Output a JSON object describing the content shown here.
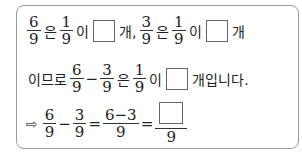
{
  "line1": {
    "f1": {
      "num": "6",
      "den": "9"
    },
    "t1": "은",
    "f2": {
      "num": "1",
      "den": "9"
    },
    "t2": "이",
    "t3": "개,",
    "f3": {
      "num": "3",
      "den": "9"
    },
    "t4": "은",
    "f4": {
      "num": "1",
      "den": "9"
    },
    "t5": "이",
    "t6": "개"
  },
  "line2": {
    "t1": "이므로",
    "f1": {
      "num": "6",
      "den": "9"
    },
    "minus": "−",
    "f2": {
      "num": "3",
      "den": "9"
    },
    "t2": "은",
    "f3": {
      "num": "1",
      "den": "9"
    },
    "t3": "이",
    "t4": "개입니다."
  },
  "line3": {
    "arrow": "⇨",
    "f1": {
      "num": "6",
      "den": "9"
    },
    "minus": "−",
    "f2": {
      "num": "3",
      "den": "9"
    },
    "eq1": "=",
    "f3": {
      "num": "6−3",
      "den": "9"
    },
    "eq2": "=",
    "f4": {
      "den": "9"
    }
  }
}
